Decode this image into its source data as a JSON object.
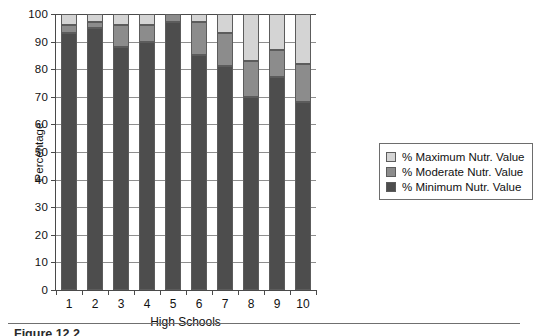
{
  "figure": {
    "caption": "Figure 12.2",
    "background": "#ffffff"
  },
  "chart_data": {
    "type": "bar",
    "stacked": true,
    "title": "",
    "subtitle": "",
    "xlabel": "High Schools",
    "ylabel": "Percentage",
    "categories": [
      "1",
      "2",
      "3",
      "4",
      "5",
      "6",
      "7",
      "8",
      "9",
      "10"
    ],
    "ylim": [
      0,
      100
    ],
    "yticks": [
      0,
      10,
      20,
      30,
      40,
      50,
      60,
      70,
      80,
      90,
      100
    ],
    "grid": true,
    "grid_axis": "y",
    "legend_position": "right",
    "series": [
      {
        "name": "% Minimum Nutr. Value",
        "color": "#4d4d4d",
        "values": [
          93,
          95,
          88,
          90,
          97,
          85,
          81,
          70,
          77,
          68
        ]
      },
      {
        "name": "% Moderate Nutr. Value",
        "color": "#8c8c8c",
        "values": [
          3,
          2,
          8,
          6,
          3,
          12,
          12,
          13,
          10,
          14
        ]
      },
      {
        "name": "% Maximum Nutr. Value",
        "color": "#d4d4d4",
        "values": [
          4,
          3,
          4,
          4,
          0,
          3,
          7,
          17,
          13,
          18
        ]
      }
    ]
  },
  "legend": {
    "entries": [
      {
        "label": "% Maximum Nutr. Value",
        "color": "#d4d4d4"
      },
      {
        "label": "% Moderate Nutr. Value",
        "color": "#8c8c8c"
      },
      {
        "label": "% Minimum Nutr. Value",
        "color": "#4d4d4d"
      }
    ]
  }
}
